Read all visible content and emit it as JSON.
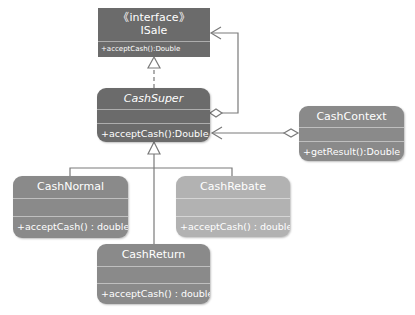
{
  "diagram": {
    "type": "uml-class-diagram",
    "colors": {
      "dark": "#6b6b6b",
      "medium": "#8a8a8a",
      "light": "#b2b2b2",
      "line": "#7a7a7a"
    },
    "classes": [
      {
        "id": "isale",
        "stereotype": "《interface》",
        "name": "ISale",
        "operations": [
          "+acceptCash():Double"
        ]
      },
      {
        "id": "cashsuper",
        "name": "CashSuper",
        "abstract": true,
        "operations": [
          "+acceptCash():Double"
        ]
      },
      {
        "id": "cashcontext",
        "name": "CashContext",
        "operations": [
          "+getResult():Double"
        ]
      },
      {
        "id": "cashnormal",
        "name": "CashNormal",
        "operations": [
          "+acceptCash() : double"
        ]
      },
      {
        "id": "cashrebate",
        "name": "CashRebate",
        "operations": [
          "+acceptCash() : double"
        ]
      },
      {
        "id": "cashreturn",
        "name": "CashReturn",
        "operations": [
          "+acceptCash() : double"
        ]
      }
    ],
    "relations": [
      {
        "from": "CashSuper",
        "to": "ISale",
        "type": "realization"
      },
      {
        "from": "CashSuper",
        "to": "ISale",
        "type": "aggregation"
      },
      {
        "from": "CashContext",
        "to": "CashSuper",
        "type": "aggregation"
      },
      {
        "from": "CashNormal",
        "to": "CashSuper",
        "type": "generalization"
      },
      {
        "from": "CashRebate",
        "to": "CashSuper",
        "type": "generalization"
      },
      {
        "from": "CashReturn",
        "to": "CashSuper",
        "type": "generalization"
      }
    ]
  }
}
